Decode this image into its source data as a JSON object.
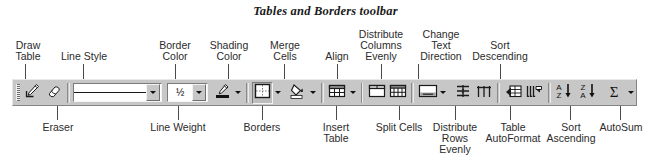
{
  "title": "Tables and Borders toolbar",
  "callouts_top": [
    {
      "label": "Draw\nTable",
      "name": "callout-draw-table"
    },
    {
      "label": "Line Style",
      "name": "callout-line-style"
    },
    {
      "label": "Border\nColor",
      "name": "callout-border-color"
    },
    {
      "label": "Shading\nColor",
      "name": "callout-shading-color"
    },
    {
      "label": "Merge\nCells",
      "name": "callout-merge-cells"
    },
    {
      "label": "Align",
      "name": "callout-align"
    },
    {
      "label": "Distribute\nColumns\nEvenly",
      "name": "callout-distribute-columns-evenly"
    },
    {
      "label": "Change\nText\nDirection",
      "name": "callout-change-text-direction"
    },
    {
      "label": "Sort\nDescending",
      "name": "callout-sort-descending"
    }
  ],
  "callouts_bottom": [
    {
      "label": "Eraser",
      "name": "callout-eraser"
    },
    {
      "label": "Line Weight",
      "name": "callout-line-weight"
    },
    {
      "label": "Borders",
      "name": "callout-borders"
    },
    {
      "label": "Insert\nTable",
      "name": "callout-insert-table"
    },
    {
      "label": "Split Cells",
      "name": "callout-split-cells"
    },
    {
      "label": "Distribute\nRows\nEvenly",
      "name": "callout-distribute-rows-evenly"
    },
    {
      "label": "Table\nAutoFormat",
      "name": "callout-table-autoformat"
    },
    {
      "label": "Sort\nAscending",
      "name": "callout-sort-ascending"
    },
    {
      "label": "AutoSum",
      "name": "callout-autosum"
    }
  ],
  "toolbar": {
    "name": "Tables and Borders",
    "line_style_value": "",
    "line_weight_value": "½",
    "buttons": [
      {
        "label": "Draw Table",
        "icon": "pencil-icon"
      },
      {
        "label": "Eraser",
        "icon": "eraser-icon"
      },
      {
        "label": "Line Style",
        "icon": "line-style-combo"
      },
      {
        "label": "Line Weight",
        "icon": "line-weight-combo"
      },
      {
        "label": "Border Color",
        "icon": "border-color-icon"
      },
      {
        "label": "Borders",
        "icon": "borders-icon"
      },
      {
        "label": "Shading Color",
        "icon": "shading-color-icon"
      },
      {
        "label": "Insert Table",
        "icon": "insert-table-icon"
      },
      {
        "label": "Merge Cells",
        "icon": "merge-cells-icon"
      },
      {
        "label": "Split Cells",
        "icon": "split-cells-icon"
      },
      {
        "label": "Align",
        "icon": "align-icon"
      },
      {
        "label": "Distribute Rows Evenly",
        "icon": "distribute-rows-icon"
      },
      {
        "label": "Distribute Columns Evenly",
        "icon": "distribute-columns-icon"
      },
      {
        "label": "Change Text Direction",
        "icon": "change-text-direction-icon"
      },
      {
        "label": "Table AutoFormat",
        "icon": "table-autoformat-icon"
      },
      {
        "label": "Sort Ascending",
        "icon": "sort-ascending-icon"
      },
      {
        "label": "Sort Descending",
        "icon": "sort-descending-icon"
      },
      {
        "label": "AutoSum",
        "icon": "autosum-icon"
      }
    ],
    "sort_ascending_glyph": "A\nZ",
    "sort_descending_glyph": "Z\nA",
    "autosum_glyph": "Σ"
  },
  "colors": {
    "toolbar_face": "#c7c7c7",
    "text": "#2b2b2b",
    "leader": "#4a4a4a",
    "icon_dark": "#1a1a1a",
    "combo_field": "#ffffff"
  }
}
